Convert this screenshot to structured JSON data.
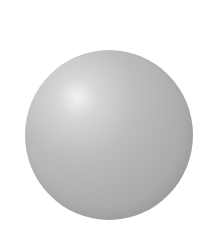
{
  "image": {
    "subject": "shaded gray sphere",
    "background_color": "#ffffff",
    "sphere_color": "#b4b4b4",
    "highlight_color": "#f2f2f2"
  }
}
